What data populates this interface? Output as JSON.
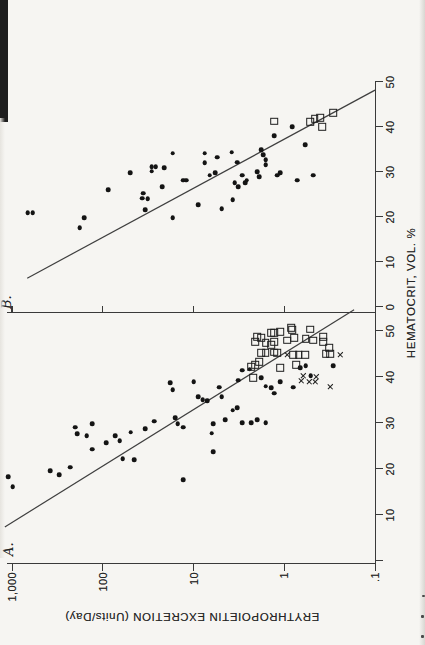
{
  "figure": {
    "panel_a_label": "A.",
    "panel_b_label": "B.",
    "x_axis_label": "HEMATOCRIT, VOL. %",
    "y_axis_label": "ERYTHROPOIETIN EXCRETION (Units/Day)",
    "y_tick_labels": [
      "1,000",
      "100",
      "10",
      "1",
      ".1"
    ],
    "y_tick_values": [
      1000,
      100,
      10,
      1,
      0.1
    ],
    "panel_a_x_ticks": [
      {
        "value": 0,
        "label": ""
      },
      {
        "value": 10,
        "label": "10"
      },
      {
        "value": 20,
        "label": "20"
      },
      {
        "value": 30,
        "label": "30"
      },
      {
        "value": 40,
        "label": "40"
      },
      {
        "value": 50,
        "label": "50"
      }
    ],
    "panel_b_x_ticks": [
      {
        "value": 0,
        "label": "0"
      },
      {
        "value": 10,
        "label": "10"
      },
      {
        "value": 20,
        "label": "20"
      },
      {
        "value": 30,
        "label": "30"
      },
      {
        "value": 40,
        "label": "40"
      },
      {
        "value": 50,
        "label": "50"
      }
    ],
    "ink_color": "#1d1d1d"
  },
  "chart_data": [
    {
      "panel": "A",
      "type": "scatter",
      "xlabel": "HEMATOCRIT, VOL. %",
      "ylabel": "ERYTHROPOIETIN EXCRETION (Units/Day)",
      "x_range": [
        0,
        55
      ],
      "y_scale": "log",
      "y_range": [
        0.1,
        1000
      ],
      "regression_line": {
        "from": [
          7.4,
          1200
        ],
        "to": [
          54.6,
          0.17
        ]
      },
      "series": [
        {
          "name": "filled-circle",
          "marker": "filled-circle",
          "points": [
            [
              18.3,
              1100
            ],
            [
              16.1,
              980
            ],
            [
              19.6,
              380
            ],
            [
              18.7,
              300
            ],
            [
              20.4,
              230
            ],
            [
              29.1,
              200
            ],
            [
              27.6,
              190
            ],
            [
              27.2,
              150
            ],
            [
              29.8,
              130
            ],
            [
              24.3,
              130
            ],
            [
              25.7,
              92
            ],
            [
              27.2,
              73
            ],
            [
              26.1,
              65
            ],
            [
              22.2,
              60
            ],
            [
              28.0,
              49
            ],
            [
              22.0,
              45
            ],
            [
              28.7,
              34
            ],
            [
              30.4,
              27
            ],
            [
              38.7,
              18
            ],
            [
              37.2,
              17
            ],
            [
              31.1,
              16
            ],
            [
              29.8,
              15
            ],
            [
              29.1,
              13
            ],
            [
              17.6,
              13
            ],
            [
              38.9,
              10
            ],
            [
              35.7,
              8.9
            ],
            [
              35.0,
              7.9
            ],
            [
              34.8,
              7.1
            ],
            [
              27.8,
              6.3
            ],
            [
              29.8,
              6.1
            ],
            [
              23.7,
              6.1
            ],
            [
              37.8,
              5.2
            ],
            [
              35.7,
              4.9
            ],
            [
              30.7,
              4.5
            ],
            [
              32.8,
              3.7
            ],
            [
              33.3,
              3.3
            ],
            [
              39.3,
              3.2
            ],
            [
              41.5,
              2.9
            ],
            [
              30.0,
              2.9
            ],
            [
              41.7,
              2.4
            ],
            [
              30.0,
              2.3
            ],
            [
              30.7,
              2.0
            ],
            [
              39.8,
              1.8
            ],
            [
              38.0,
              1.6
            ],
            [
              30.0,
              1.6
            ],
            [
              37.6,
              1.4
            ],
            [
              36.5,
              1.3
            ],
            [
              38.9,
              1.1
            ],
            [
              37.8,
              0.8
            ],
            [
              42.0,
              0.67
            ],
            [
              42.4,
              0.58
            ],
            [
              40.2,
              0.51
            ],
            [
              42.4,
              0.29
            ]
          ]
        },
        {
          "name": "open-square",
          "marker": "open-square",
          "points": [
            [
              50.7,
              0.84
            ],
            [
              50.4,
              0.52
            ],
            [
              48.7,
              2.0
            ],
            [
              48.5,
              1.8
            ],
            [
              49.6,
              1.4
            ],
            [
              49.6,
              1.3
            ],
            [
              49.8,
              1.1
            ],
            [
              50.2,
              0.82
            ],
            [
              47.6,
              2.1
            ],
            [
              47.4,
              1.6
            ],
            [
              47.0,
              1.4
            ],
            [
              47.6,
              1.3
            ],
            [
              48.0,
              0.93
            ],
            [
              48.5,
              0.78
            ],
            [
              48.3,
              0.58
            ],
            [
              48.0,
              0.48
            ],
            [
              48.7,
              0.37
            ],
            [
              47.6,
              0.37
            ],
            [
              45.2,
              1.8
            ],
            [
              45.2,
              1.6
            ],
            [
              45.4,
              1.3
            ],
            [
              45.2,
              1.2
            ],
            [
              44.8,
              0.8
            ],
            [
              44.8,
              0.69
            ],
            [
              44.8,
              0.59
            ],
            [
              45.0,
              0.35
            ],
            [
              45.0,
              0.31
            ],
            [
              42.2,
              2.3
            ],
            [
              42.6,
              2.1
            ],
            [
              43.3,
              1.9
            ],
            [
              42.0,
              1.1
            ],
            [
              42.6,
              0.74
            ],
            [
              46.3,
              0.32
            ],
            [
              39.8,
              2.2
            ]
          ]
        },
        {
          "name": "x-cross",
          "marker": "x-cross",
          "points": [
            [
              44.8,
              0.93
            ],
            [
              44.8,
              0.24
            ],
            [
              40.2,
              0.62
            ],
            [
              40.0,
              0.44
            ],
            [
              39.1,
              0.65
            ],
            [
              38.9,
              0.53
            ],
            [
              38.9,
              0.45
            ],
            [
              37.8,
              0.31
            ]
          ]
        }
      ]
    },
    {
      "panel": "B",
      "type": "scatter",
      "xlabel": "HEMATOCRIT, VOL. %",
      "ylabel": "ERYTHROPOIETIN EXCRETION (Units/Day)",
      "x_range": [
        0,
        50
      ],
      "y_scale": "log",
      "y_range": [
        0.1,
        1000
      ],
      "regression_line": {
        "from": [
          6.4,
          680
        ],
        "to": [
          48.2,
          0.1
        ]
      },
      "series": [
        {
          "name": "filled-circle",
          "marker": "filled-circle",
          "points": [
            [
              20.9,
              670
            ],
            [
              20.9,
              590
            ],
            [
              17.6,
              180
            ],
            [
              19.8,
              160
            ],
            [
              26.0,
              87
            ],
            [
              29.8,
              50
            ],
            [
              24.2,
              37
            ],
            [
              24.0,
              32
            ],
            [
              25.3,
              36
            ],
            [
              21.6,
              34
            ],
            [
              31.1,
              29
            ],
            [
              31.1,
              26
            ],
            [
              30.2,
              29
            ],
            [
              30.9,
              21
            ],
            [
              26.7,
              22
            ],
            [
              34.2,
              17
            ],
            [
              19.8,
              17
            ],
            [
              28.2,
              13
            ],
            [
              28.2,
              12
            ],
            [
              22.7,
              8.9
            ],
            [
              34.2,
              7.5
            ],
            [
              32.0,
              7.5
            ],
            [
              29.3,
              6.6
            ],
            [
              29.8,
              5.8
            ],
            [
              33.3,
              5.5
            ],
            [
              21.8,
              4.9
            ],
            [
              34.4,
              3.8
            ],
            [
              23.8,
              3.7
            ],
            [
              27.6,
              3.5
            ],
            [
              32.2,
              3.3
            ],
            [
              26.7,
              3.2
            ],
            [
              29.3,
              2.9
            ],
            [
              27.6,
              2.7
            ],
            [
              28.2,
              2.6
            ],
            [
              30.0,
              2.0
            ],
            [
              28.9,
              1.9
            ],
            [
              34.9,
              1.8
            ],
            [
              33.8,
              1.7
            ],
            [
              32.7,
              1.6
            ],
            [
              31.6,
              1.6
            ],
            [
              38.0,
              1.3
            ],
            [
              29.3,
              1.2
            ],
            [
              29.8,
              1.1
            ],
            [
              40.0,
              0.82
            ],
            [
              28.2,
              0.72
            ],
            [
              36.0,
              0.59
            ],
            [
              29.3,
              0.48
            ]
          ]
        },
        {
          "name": "open-square",
          "marker": "open-square",
          "points": [
            [
              41.3,
              1.3
            ],
            [
              41.1,
              0.52
            ],
            [
              41.8,
              0.46
            ],
            [
              42.0,
              0.4
            ],
            [
              40.0,
              0.38
            ],
            [
              43.1,
              0.29
            ]
          ]
        }
      ]
    }
  ]
}
